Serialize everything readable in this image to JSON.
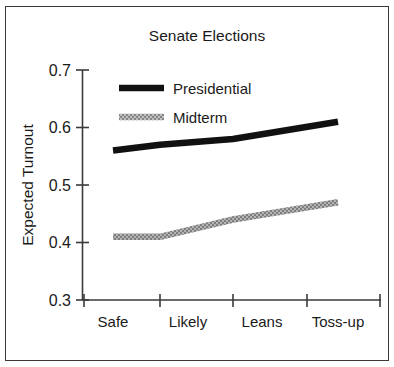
{
  "figure": {
    "border_color": "#3a3a3a",
    "background": "#ffffff"
  },
  "chart_data": {
    "type": "line",
    "title": "Senate Elections",
    "xlabel": "",
    "ylabel": "Expected Turnout",
    "categories": [
      "Safe",
      "Likely",
      "Leans",
      "Toss-up"
    ],
    "ylim": [
      0.3,
      0.7
    ],
    "yticks": [
      "0.3",
      "0.4",
      "0.5",
      "0.6",
      "0.7"
    ],
    "ytick_values": [
      0.3,
      0.4,
      0.5,
      0.6,
      0.7
    ],
    "grid": false,
    "legend_position": "upper-left-inside",
    "series": [
      {
        "name": "Presidential",
        "color": "#111111",
        "style": "solid-thick",
        "values": [
          0.56,
          0.57,
          0.58,
          0.61
        ]
      },
      {
        "name": "Midterm",
        "color": "#9a9a9a",
        "style": "hatched-thick",
        "values": [
          0.41,
          0.41,
          0.44,
          0.47
        ]
      }
    ]
  },
  "legend": {
    "items": [
      {
        "label": "Presidential"
      },
      {
        "label": "Midterm"
      }
    ]
  }
}
